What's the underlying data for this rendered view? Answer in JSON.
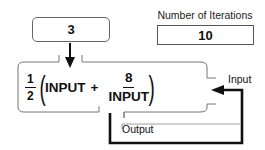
{
  "input_box": {
    "value": "3"
  },
  "iterations": {
    "label": "Number of Iterations",
    "value": "10"
  },
  "formula": {
    "coefficient_numerator": "1",
    "coefficient_denominator": "2",
    "term1": "INPUT",
    "operator": "+",
    "fraction_numerator": "8",
    "fraction_denominator": "INPUT",
    "open_paren": "(",
    "close_paren": ")"
  },
  "labels": {
    "input": "Input",
    "output": "Output"
  },
  "colors": {
    "stroke": "#111111",
    "box_border": "#666666",
    "background": "#ffffff"
  }
}
